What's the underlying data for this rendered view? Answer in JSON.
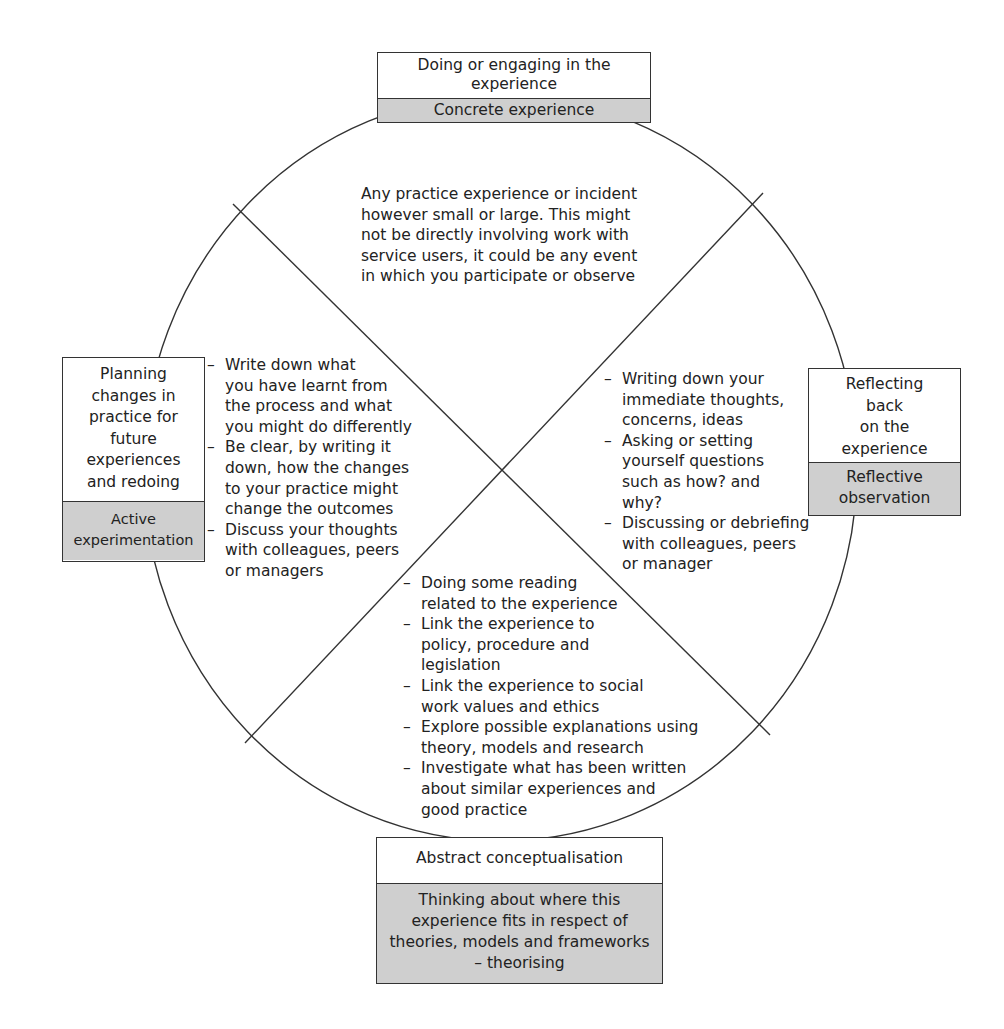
{
  "diagram": {
    "stages": {
      "top": {
        "description": "Doing or engaging in the experience",
        "label": "Concrete experience"
      },
      "right": {
        "description_lines": [
          "Reflecting",
          "back",
          "on the",
          "experience"
        ],
        "label_lines": [
          "Reflective",
          "observation"
        ]
      },
      "bottom": {
        "label": "Abstract conceptualisation",
        "description_lines": [
          "Thinking about where this",
          "experience fits in respect of",
          "theories, models and frameworks",
          "– theorising"
        ]
      },
      "left": {
        "description_lines": [
          "Planning",
          "changes in",
          "practice for",
          "future",
          "experiences",
          "and redoing"
        ],
        "label_lines": [
          "Active",
          "experimentation"
        ]
      }
    },
    "quadrants": {
      "top": {
        "lines": [
          "Any practice experience or incident",
          "however small or large. This might",
          "not be directly involving work with",
          "service users, it could be any event",
          "in which you participate or observe"
        ]
      },
      "right": {
        "items": [
          [
            "Writing down your",
            "immediate thoughts,",
            "concerns, ideas"
          ],
          [
            "Asking or setting",
            "yourself questions",
            "such as how? and",
            "why?"
          ],
          [
            "Discussing or debriefing",
            "with colleagues, peers",
            "or manager"
          ]
        ]
      },
      "bottom": {
        "items": [
          [
            "Doing some reading",
            "related to the experience"
          ],
          [
            "Link the experience to",
            "policy, procedure and",
            "legislation"
          ],
          [
            "Link the experience to social",
            "work values and ethics"
          ],
          [
            "Explore possible explanations using",
            "theory, models and research"
          ],
          [
            "Investigate what has been written",
            "about similar experiences and",
            "good practice"
          ]
        ]
      },
      "left": {
        "items": [
          [
            "Write down what",
            "you have learnt from",
            "the process and what",
            "you might do differently"
          ],
          [
            "Be clear, by writing it",
            "down, how the changes",
            "to your practice might",
            "change the outcomes"
          ],
          [
            "Discuss your thoughts",
            "with colleagues, peers",
            "or managers"
          ]
        ]
      }
    },
    "colors": {
      "line": "#333333",
      "label_fill": "#cfcfcf",
      "background": "#ffffff"
    }
  }
}
